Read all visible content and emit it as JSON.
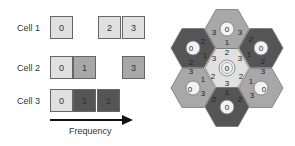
{
  "colors": {
    "light": "#e0e0e0",
    "medium": "#a8a8a8",
    "dark": "#555555",
    "border": "#666666"
  },
  "channels": {
    "cells": [
      {
        "label": "Cell 1",
        "slots": [
          {
            "channel": "0",
            "shade": "light",
            "x": 50
          },
          {
            "channel": "2",
            "shade": "light",
            "x": 98
          },
          {
            "channel": "3",
            "shade": "light",
            "x": 122
          }
        ]
      },
      {
        "label": "Cell 2",
        "slots": [
          {
            "channel": "0",
            "shade": "light",
            "x": 50
          },
          {
            "channel": "1",
            "shade": "medium",
            "x": 73
          },
          {
            "channel": "3",
            "shade": "medium",
            "x": 122
          }
        ]
      },
      {
        "label": "Cell 3",
        "slots": [
          {
            "channel": "0",
            "shade": "light",
            "x": 50
          },
          {
            "channel": "1",
            "shade": "dark",
            "x": 73
          },
          {
            "channel": "2",
            "shade": "dark",
            "x": 97
          }
        ]
      }
    ],
    "axis_label": "Frequency"
  },
  "hex_grid": {
    "hexes": [
      {
        "position": "center",
        "shade": "light",
        "center_label": "0",
        "ring": true,
        "edges": {
          "top": "2",
          "upper_left": "3",
          "upper_right": "3",
          "lower_left": "2",
          "lower_right": "2",
          "bottom": "3"
        }
      },
      {
        "position": "top",
        "shade": "medium",
        "center_label": "0",
        "edges": {
          "left": "3",
          "right": "3",
          "bottom": "1"
        }
      },
      {
        "position": "top-left",
        "shade": "dark",
        "center_label": "0",
        "edges": {
          "upper_right": "2",
          "lower_right": "1",
          "bottom": "2"
        }
      },
      {
        "position": "top-right",
        "shade": "dark",
        "center_label": "0",
        "edges": {
          "upper_left": "2",
          "lower_left": "1",
          "bottom": "2"
        }
      },
      {
        "position": "bottom-left",
        "shade": "medium",
        "center_label": "0",
        "edges": {
          "top": "3",
          "right": "1",
          "lower_right": "3"
        }
      },
      {
        "position": "bottom-right",
        "shade": "medium",
        "center_label": "0",
        "edges": {
          "top": "3",
          "left": "1",
          "lower_left": "3"
        }
      },
      {
        "position": "bottom",
        "shade": "dark",
        "center_label": "0",
        "edges": {
          "top": "1",
          "upper_left": "2",
          "upper_right": "2"
        }
      }
    ]
  }
}
